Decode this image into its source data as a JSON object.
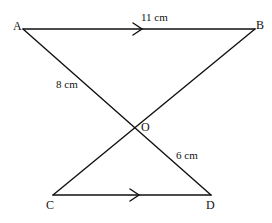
{
  "diagram": {
    "points": {
      "A": {
        "label": "A",
        "x": 23,
        "y": 29
      },
      "B": {
        "label": "B",
        "x": 255,
        "y": 29
      },
      "O": {
        "label": "O",
        "x": 134,
        "y": 128
      },
      "C": {
        "label": "C",
        "x": 53,
        "y": 195
      },
      "D": {
        "label": "D",
        "x": 211,
        "y": 195
      }
    },
    "segments": [
      {
        "from": "A",
        "to": "B",
        "parallel_arrow": true
      },
      {
        "from": "A",
        "to": "D"
      },
      {
        "from": "B",
        "to": "C"
      },
      {
        "from": "C",
        "to": "D",
        "parallel_arrow": true
      }
    ],
    "lengths": {
      "AB": "11 cm",
      "AO": "8 cm",
      "OD": "6 cm"
    },
    "line_color": "#111111"
  }
}
